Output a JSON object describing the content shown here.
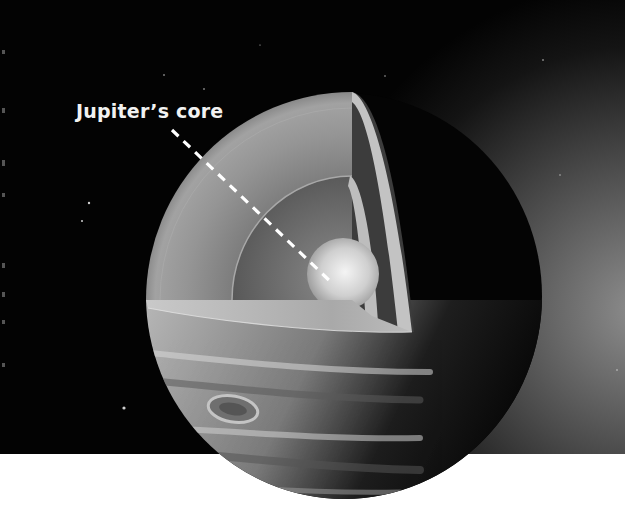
{
  "figure": {
    "style": "grayscale",
    "background": {
      "space_color": "#030303",
      "glow_color": "#8c8c8c",
      "page_color": "#ffffff"
    },
    "colors": {
      "outer_layer": "#8d8d8d",
      "inner_cavity": "#5e5e5e",
      "core": "#d8d8d8",
      "slab_top": "#b4b4b4",
      "dark_hemisphere": "#050505",
      "label_text": "#f2f2f2",
      "leader_line": "#ffffff"
    }
  },
  "annotations": [
    {
      "text": "Jupiter’s core",
      "target": "core",
      "leader": "dashed"
    }
  ]
}
